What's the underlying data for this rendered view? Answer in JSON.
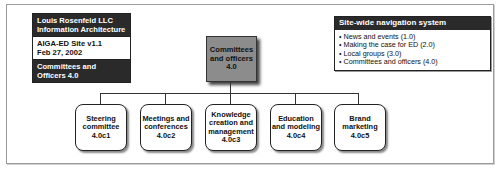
{
  "info_box": {
    "company": "Louis Rosenfeld LLC",
    "discipline": "Information Architecture",
    "site": "AIGA-ED Site v1.1",
    "date": "Feb 27, 2002",
    "page": "Committees and Officers 4.0"
  },
  "nav_box": {
    "title": "Site-wide navigation system",
    "items": [
      "News and events (1.0)",
      "Making the case for ED (2.0)",
      "Local groups (3.0)",
      "Committees and officers (4.0)"
    ]
  },
  "root": {
    "line1": "Committees",
    "line2": "and officers",
    "id": "4.0"
  },
  "children": [
    {
      "lines": [
        "Steering",
        "committee"
      ],
      "id": "4.0c1"
    },
    {
      "lines": [
        "Meetings and",
        "conferences"
      ],
      "id": "4.0c2"
    },
    {
      "lines": [
        "Knowledge",
        "creation and",
        "management"
      ],
      "id": "4.0c3"
    },
    {
      "lines": [
        "Education",
        "and modeling"
      ],
      "id": "4.0c4"
    },
    {
      "lines": [
        "Brand",
        "marketing"
      ],
      "id": "4.0c5"
    }
  ]
}
